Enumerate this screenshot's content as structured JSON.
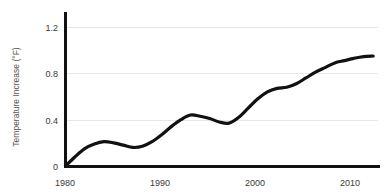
{
  "chart_data": {
    "type": "line",
    "title": "",
    "subtitle": "",
    "xlabel": "",
    "ylabel": "Temperature Increase (°F)",
    "xlim": [
      1980,
      2012.5
    ],
    "ylim": [
      0,
      1.3
    ],
    "grid": true,
    "legend": "none",
    "xticks": [
      1980,
      1990,
      2000,
      2010
    ],
    "xtick_labels": [
      "1980",
      "1990",
      "2000",
      "2010"
    ],
    "yticks": [
      0,
      0.4,
      0.8,
      1.2
    ],
    "ytick_labels": [
      "0",
      "0.4",
      "0.8",
      "1.2"
    ],
    "series": [
      {
        "name": "Temperature Increase",
        "color": "#111111",
        "x": [
          1980,
          1981,
          1982,
          1983,
          1984,
          1985,
          1986,
          1987,
          1988,
          1989,
          1990,
          1991,
          1992,
          1993,
          1994,
          1995,
          1996,
          1997,
          1998,
          1999,
          2000,
          2001,
          2002,
          2003,
          2004,
          2005,
          2006,
          2007,
          2008,
          2009,
          2010,
          2011,
          2012
        ],
        "y": [
          0.0,
          0.08,
          0.15,
          0.19,
          0.21,
          0.2,
          0.18,
          0.16,
          0.17,
          0.21,
          0.27,
          0.34,
          0.4,
          0.44,
          0.43,
          0.41,
          0.38,
          0.37,
          0.42,
          0.5,
          0.58,
          0.64,
          0.67,
          0.68,
          0.71,
          0.76,
          0.81,
          0.85,
          0.89,
          0.91,
          0.93,
          0.945,
          0.95
        ]
      }
    ],
    "annotations": []
  },
  "axis": {
    "y_title": "Temperature Increase (°F)",
    "y_tick_0": "0",
    "y_tick_1": "0.4",
    "y_tick_2": "0.8",
    "y_tick_3": "1.2",
    "x_tick_0": "1980",
    "x_tick_1": "1990",
    "x_tick_2": "2000",
    "x_tick_3": "2010"
  },
  "colors": {
    "background": "#ffffff",
    "axis": "#111111",
    "grid": "#e8e8e8",
    "line": "#111111",
    "tick_text": "#3a3a3a",
    "axis_label_text": "#555555"
  }
}
